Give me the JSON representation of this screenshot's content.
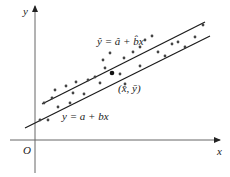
{
  "diagram": {
    "type": "scatter_with_regression_lines",
    "axes": {
      "x_label": "x",
      "y_label": "y",
      "origin_label": "O"
    },
    "lines": [
      {
        "id": "fitted",
        "label": "ŷ = â + b̂x",
        "x1": 25,
        "y1": 128,
        "x2": 210,
        "y2": 36
      },
      {
        "id": "true",
        "label": "y = a + bx",
        "x1": 42,
        "y1": 104,
        "x2": 205,
        "y2": 22
      }
    ],
    "centroid": {
      "label": "(x̄, ȳ)",
      "x": 112,
      "y": 73
    },
    "points": [
      [
        40,
        120
      ],
      [
        48,
        120
      ],
      [
        44,
        103
      ],
      [
        52,
        98
      ],
      [
        58,
        107
      ],
      [
        70,
        103
      ],
      [
        55,
        90
      ],
      [
        66,
        86
      ],
      [
        76,
        82
      ],
      [
        73,
        93
      ],
      [
        88,
        80
      ],
      [
        95,
        77
      ],
      [
        100,
        83
      ],
      [
        84,
        94
      ],
      [
        105,
        68
      ],
      [
        120,
        74
      ],
      [
        124,
        58
      ],
      [
        133,
        52
      ],
      [
        140,
        47
      ],
      [
        145,
        40
      ],
      [
        152,
        36
      ],
      [
        158,
        52
      ],
      [
        165,
        56
      ],
      [
        172,
        44
      ],
      [
        178,
        42
      ],
      [
        185,
        47
      ],
      [
        195,
        37
      ],
      [
        203,
        25
      ],
      [
        110,
        53
      ],
      [
        140,
        66
      ],
      [
        103,
        60
      ],
      [
        125,
        84
      ]
    ]
  },
  "labels": {
    "y_axis": "y",
    "x_axis": "x",
    "origin": "O",
    "fitted_line": "ŷ = â + b̂x",
    "true_line": "y = a + bx",
    "centroid": "(x̄, ȳ)"
  },
  "colors": {
    "axis": "#555555",
    "line": "#1a1a1a",
    "point": "#444444",
    "text": "#222222"
  }
}
